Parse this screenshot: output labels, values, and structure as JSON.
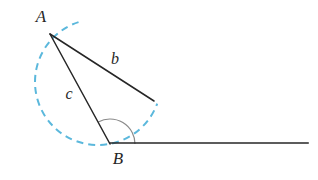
{
  "figure": {
    "name": "triangle-with-angle-arc-and-dashed-circle",
    "background_color": "#ffffff",
    "line_color": "#262626",
    "arc_color": "#8a8a8a",
    "dashed_arc_color": "#5bb8dc",
    "label_color": "#262626",
    "vertices": {
      "A": {
        "label": "A",
        "x": 50,
        "y": 34,
        "label_x": 41,
        "label_y": 22
      },
      "B": {
        "label": "B",
        "x": 110,
        "y": 144,
        "label_x": 118,
        "label_y": 164
      },
      "b_endpoint": {
        "x": 154,
        "y": 101
      },
      "ray_end": {
        "x": 308,
        "y": 143
      }
    },
    "sides": [
      {
        "name": "b",
        "label": "b",
        "from": "A",
        "to": "b_endpoint",
        "label_x": 115,
        "label_y": 64
      },
      {
        "name": "c",
        "label": "c",
        "from": "A",
        "to": "B",
        "label_x": 69,
        "label_y": 99
      }
    ],
    "angle_arc": {
      "name": "angle-at-B",
      "center_x": 110,
      "center_y": 144,
      "radius": 25,
      "start_angle_deg": 0,
      "end_angle_deg": 118
    },
    "dashed_arc": {
      "name": "dashed-circle-arc",
      "center_x": 98,
      "center_y": 82,
      "radius": 63,
      "start_angle_deg": 108,
      "end_angle_deg": 340,
      "dash_pattern": "7 5",
      "stroke_width": 2
    },
    "horizontal_ray": {
      "name": "horizontal-ray-from-B",
      "x1": 110,
      "y1": 143,
      "x2": 308,
      "y2": 143
    }
  }
}
